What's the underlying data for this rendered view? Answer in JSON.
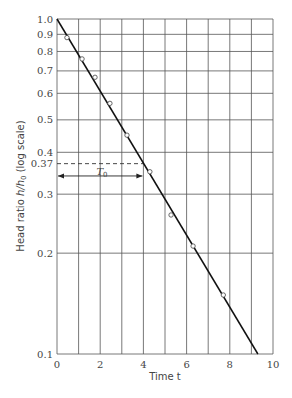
{
  "chart_data": {
    "type": "line",
    "title": "",
    "xlabel": "Time  t",
    "ylabel": "Head ratio h/h0 (log scale)",
    "xlim": [
      0,
      10
    ],
    "ylim": [
      0.1,
      1.0
    ],
    "yscale": "log",
    "grid": true,
    "x_ticks": [
      0,
      2,
      4,
      6,
      8,
      10
    ],
    "x_gridlines": [
      0,
      1,
      2,
      3,
      4,
      5,
      6,
      7,
      8,
      9,
      10
    ],
    "y_ticks": [
      1.0,
      0.9,
      0.8,
      0.7,
      0.6,
      0.5,
      0.4,
      0.37,
      0.3,
      0.2,
      0.1
    ],
    "y_tick_labels": [
      "1.0",
      "0.9",
      "0.8",
      "0.7",
      "0.6",
      "0.5",
      "0.4",
      "0.37",
      "0.3",
      "0.2",
      "0.1"
    ],
    "y_gridlines": [
      1.0,
      0.9,
      0.8,
      0.7,
      0.6,
      0.5,
      0.4,
      0.3,
      0.2,
      0.1
    ],
    "series": [
      {
        "name": "Observed data",
        "style": "open-circle markers",
        "x": [
          0.46,
          1.16,
          1.76,
          2.45,
          3.24,
          4.3,
          5.28,
          6.3,
          7.7
        ],
        "y": [
          0.88,
          0.76,
          0.67,
          0.56,
          0.45,
          0.35,
          0.26,
          0.21,
          0.15
        ]
      },
      {
        "name": "Best-fit line",
        "style": "solid line",
        "x": [
          0,
          9.3
        ],
        "y": [
          1.0,
          0.1
        ]
      }
    ],
    "annotations": [
      {
        "type": "dashed-horizontal-line",
        "y": 0.37,
        "x_from": 0,
        "x_to": 4.0
      },
      {
        "type": "double-arrow",
        "label": "T0",
        "x_from": 0,
        "x_to": 4.0,
        "y": 0.34
      }
    ],
    "legend": "none"
  },
  "labels": {
    "xlabel": "Time  t",
    "ylabel_main": "Head ratio ",
    "ylabel_var": "h/h",
    "ylabel_sub": "0",
    "ylabel_tail": " (log scale)",
    "t0_main": "T",
    "t0_sub": "0"
  }
}
